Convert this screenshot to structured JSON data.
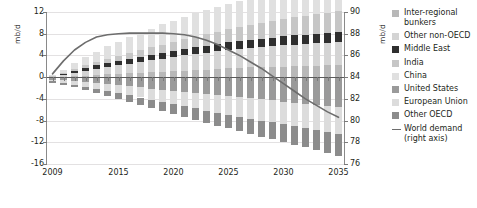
{
  "chart_data": {
    "type": "bar",
    "subtype": "stacked-bar-with-line-overlay",
    "title": "",
    "xlabel": "",
    "ylabel": "mb/d",
    "ylabel_right": "mb/d",
    "ylim": [
      -16,
      12
    ],
    "ylim_right": [
      76,
      90
    ],
    "yticks": [
      12,
      8,
      4,
      0,
      -4,
      -8,
      -12,
      -16
    ],
    "yticks_right": [
      90,
      88,
      86,
      84,
      82,
      80,
      78,
      76
    ],
    "xticks": [
      2009,
      2015,
      2020,
      2025,
      2030,
      2035
    ],
    "xlim": [
      2009,
      2035
    ],
    "grid": true,
    "legend_position": "right",
    "categories": [
      2009,
      2010,
      2011,
      2012,
      2013,
      2014,
      2015,
      2016,
      2017,
      2018,
      2019,
      2020,
      2021,
      2022,
      2023,
      2024,
      2025,
      2026,
      2027,
      2028,
      2029,
      2030,
      2031,
      2032,
      2033,
      2034,
      2035
    ],
    "series": [
      {
        "name": "Inter-regional bunkers",
        "color": "#b8b8b8",
        "values": [
          0.05,
          0.1,
          0.2,
          0.3,
          0.4,
          0.5,
          0.6,
          0.7,
          0.8,
          0.9,
          1.0,
          1.1,
          1.2,
          1.3,
          1.4,
          1.5,
          1.6,
          1.7,
          1.8,
          1.85,
          1.9,
          1.95,
          2.0,
          2.05,
          2.1,
          2.15,
          2.2
        ]
      },
      {
        "name": "Other non-OECD",
        "color": "#d4d4d4",
        "values": [
          0.1,
          0.35,
          0.6,
          0.9,
          1.15,
          1.4,
          1.6,
          1.8,
          2.0,
          2.2,
          2.4,
          2.6,
          2.8,
          2.95,
          3.1,
          3.25,
          3.4,
          3.5,
          3.6,
          3.7,
          3.8,
          3.9,
          4.0,
          4.05,
          4.1,
          4.15,
          4.2
        ]
      },
      {
        "name": "Middle East",
        "color": "#2f2f2f",
        "values": [
          0.05,
          0.2,
          0.35,
          0.5,
          0.6,
          0.7,
          0.8,
          0.9,
          1.0,
          1.05,
          1.1,
          1.15,
          1.2,
          1.25,
          1.3,
          1.35,
          1.4,
          1.45,
          1.5,
          1.55,
          1.6,
          1.65,
          1.7,
          1.75,
          1.8,
          1.85,
          1.9
        ]
      },
      {
        "name": "India",
        "color": "#c6c6c6",
        "values": [
          0.05,
          0.15,
          0.3,
          0.45,
          0.6,
          0.75,
          0.9,
          1.05,
          1.2,
          1.35,
          1.5,
          1.65,
          1.8,
          1.95,
          2.1,
          2.25,
          2.4,
          2.55,
          2.7,
          2.85,
          3.0,
          3.15,
          3.3,
          3.45,
          3.6,
          3.75,
          3.9
        ]
      },
      {
        "name": "China",
        "color": "#e0e0e0",
        "values": [
          0.15,
          0.6,
          1.1,
          1.55,
          1.95,
          2.3,
          2.6,
          2.9,
          3.2,
          3.45,
          3.7,
          3.9,
          4.1,
          4.3,
          4.45,
          4.6,
          4.75,
          4.85,
          4.95,
          5.05,
          5.15,
          5.2,
          5.3,
          5.35,
          5.4,
          5.45,
          5.5
        ]
      },
      {
        "name": "United States",
        "color": "#9a9a9a",
        "values": [
          -0.5,
          -0.6,
          -0.75,
          -0.9,
          -1.1,
          -1.3,
          -1.5,
          -1.7,
          -1.9,
          -2.1,
          -2.3,
          -2.5,
          -2.7,
          -2.9,
          -3.1,
          -3.3,
          -3.5,
          -3.7,
          -3.9,
          -4.1,
          -4.3,
          -4.5,
          -4.7,
          -4.9,
          -5.1,
          -5.3,
          -5.5
        ]
      },
      {
        "name": "European Union",
        "color": "#dcdcdc",
        "values": [
          -0.3,
          -0.45,
          -0.65,
          -0.85,
          -1.05,
          -1.25,
          -1.45,
          -1.65,
          -1.85,
          -2.05,
          -2.25,
          -2.45,
          -2.65,
          -2.85,
          -3.05,
          -3.25,
          -3.45,
          -3.6,
          -3.75,
          -3.9,
          -4.05,
          -4.2,
          -4.35,
          -4.5,
          -4.65,
          -4.8,
          -4.95
        ]
      },
      {
        "name": "Other OECD",
        "color": "#8c8c8c",
        "values": [
          -0.25,
          -0.35,
          -0.45,
          -0.6,
          -0.75,
          -0.9,
          -1.05,
          -1.2,
          -1.35,
          -1.5,
          -1.65,
          -1.8,
          -1.95,
          -2.1,
          -2.25,
          -2.4,
          -2.5,
          -2.65,
          -2.8,
          -2.95,
          -3.1,
          -3.25,
          -3.4,
          -3.55,
          -3.7,
          -3.85,
          -4.0
        ]
      }
    ],
    "line_series": {
      "name": "World demand (right axis)",
      "axis": "right",
      "color": "#6d6d6d",
      "values": [
        84.3,
        85.5,
        86.5,
        87.2,
        87.7,
        87.9,
        88.0,
        88.05,
        88.05,
        88.05,
        88.05,
        88.0,
        87.9,
        87.7,
        87.4,
        87.0,
        86.5,
        86.0,
        85.4,
        84.8,
        84.1,
        83.4,
        82.7,
        82.0,
        81.4,
        80.8,
        80.3
      ]
    }
  },
  "axes": {
    "left": {
      "unit": "mb/d",
      "ticks": [
        "12",
        "8",
        "4",
        "0",
        "-4",
        "-8",
        "-12",
        "-16"
      ]
    },
    "right": {
      "unit": "mb/d",
      "ticks": [
        "90",
        "88",
        "86",
        "84",
        "82",
        "80",
        "78",
        "76"
      ]
    },
    "x": {
      "ticks": [
        "2009",
        "2015",
        "2020",
        "2025",
        "2030",
        "2035"
      ]
    }
  },
  "legend": {
    "items": [
      {
        "label": "Inter-regional\nbunkers",
        "color": "#b8b8b8",
        "marker": "square"
      },
      {
        "label": "Other non-OECD",
        "color": "#d4d4d4",
        "marker": "square"
      },
      {
        "label": "Middle East",
        "color": "#2f2f2f",
        "marker": "square"
      },
      {
        "label": "India",
        "color": "#c6c6c6",
        "marker": "square"
      },
      {
        "label": "China",
        "color": "#e0e0e0",
        "marker": "square"
      },
      {
        "label": "United States",
        "color": "#9a9a9a",
        "marker": "square"
      },
      {
        "label": "European Union",
        "color": "#dcdcdc",
        "marker": "square"
      },
      {
        "label": "Other OECD",
        "color": "#8c8c8c",
        "marker": "square"
      },
      {
        "label": "World demand\n(right axis)",
        "color": "#6d6d6d",
        "marker": "line"
      }
    ]
  }
}
